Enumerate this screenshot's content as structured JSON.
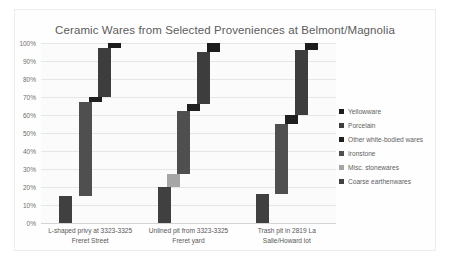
{
  "chart_data": {
    "type": "bar",
    "subtype": "100% stacked bar",
    "title": "Ceramic Wares from Selected Proveniences at Belmont/Magnolia",
    "xlabel": "",
    "ylabel": "",
    "ylim": [
      0,
      100
    ],
    "yticks": [
      "0%",
      "10%",
      "20%",
      "30%",
      "40%",
      "50%",
      "60%",
      "70%",
      "80%",
      "90%",
      "100%"
    ],
    "grid": true,
    "legend_position": "right",
    "categories": [
      "L-shaped privy at 3323-3325 Freret Street",
      "Unlined pit from 3323-3325 Freret yard",
      "Trash pit in 2819 La Salle/Howard lot"
    ],
    "series": [
      {
        "name": "Yellowware",
        "color": "#1c1c1c",
        "values": [
          3,
          5,
          4
        ]
      },
      {
        "name": "Porcelain",
        "color": "#3d3d3d",
        "values": [
          27,
          29,
          36
        ]
      },
      {
        "name": "Other white-bodied wares",
        "color": "#1f1f1f",
        "values": [
          3,
          4,
          5
        ]
      },
      {
        "name": "Ironstone",
        "color": "#4f4f4f",
        "values": [
          52,
          35,
          39
        ]
      },
      {
        "name": "Misc. stonewares",
        "color": "#a6a6a6",
        "values": [
          0,
          7,
          0
        ]
      },
      {
        "name": "Coarse earthenwares",
        "color": "#404040",
        "values": [
          15,
          20,
          16
        ]
      }
    ]
  },
  "axis": {
    "y_labels": [
      "100%",
      "90%",
      "80%",
      "70%",
      "60%",
      "50%",
      "40%",
      "30%",
      "20%",
      "10%",
      "0%"
    ],
    "x_labels": [
      "L-shaped privy at 3323-3325\nFreret Street",
      "Unlined pit from 3323-3325\nFreret yard",
      "Trash pit in 2819 La\nSalle/Howard lot"
    ]
  },
  "legend": {
    "items": [
      {
        "label": "Yellowware",
        "color": "#1c1c1c"
      },
      {
        "label": "Porcelain",
        "color": "#3d3d3d"
      },
      {
        "label": "Other white-bodied wares",
        "color": "#1f1f1f"
      },
      {
        "label": "Ironstone",
        "color": "#4f4f4f"
      },
      {
        "label": "Misc. stonewares",
        "color": "#a6a6a6"
      },
      {
        "label": "Coarse earthenwares",
        "color": "#404040"
      }
    ]
  }
}
